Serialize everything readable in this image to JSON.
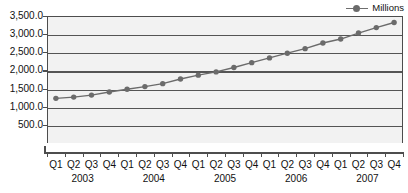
{
  "legend": {
    "position": "top-right",
    "entries": [
      {
        "label": "Millions",
        "marker": "line-circle-marker",
        "color": "#6b6b6b"
      }
    ]
  },
  "colors": {
    "series": "#6b6b6b",
    "marker": "#6b6b6b",
    "gridline": "#555555",
    "axis": "#4d4d4d",
    "plot_background": "#f2f2f2",
    "text": "#111111"
  },
  "chart_data": {
    "type": "line",
    "title": "",
    "subtitle": "",
    "xlabel": "",
    "ylabel": "",
    "ylim": [
      0,
      3500
    ],
    "ytick_labels": [
      "3,500.0",
      "3,000.0",
      "2,500.0",
      "2,000.0",
      "1,500.0",
      "1,000.0",
      "500.0"
    ],
    "ytick_values": [
      3500,
      3000,
      2500,
      2000,
      1500,
      1000,
      500
    ],
    "grid": true,
    "legend_position": "top-right",
    "categories": [
      "Q1 2003",
      "Q2 2003",
      "Q3 2003",
      "Q4 2003",
      "Q1 2004",
      "Q2 2004",
      "Q3 2004",
      "Q4 2004",
      "Q1 2005",
      "Q2 2005",
      "Q3 2005",
      "Q4 2005",
      "Q1 2006",
      "Q2 2006",
      "Q3 2006",
      "Q4 2006",
      "Q1 2007",
      "Q2 2007",
      "Q3 2007",
      "Q4 2007"
    ],
    "quarter_labels": [
      "Q1",
      "Q2",
      "Q3",
      "Q4",
      "Q1",
      "Q2",
      "Q3",
      "Q4",
      "Q1",
      "Q2",
      "Q3",
      "Q4",
      "Q1",
      "Q2",
      "Q3",
      "Q4",
      "Q1",
      "Q2",
      "Q3",
      "Q4"
    ],
    "year_labels": [
      "2003",
      "2004",
      "2005",
      "2006",
      "2007"
    ],
    "series": [
      {
        "name": "Millions",
        "values": [
          1230,
          1265,
          1320,
          1405,
          1480,
          1555,
          1635,
          1765,
          1870,
          1960,
          2080,
          2215,
          2345,
          2475,
          2600,
          2755,
          2865,
          3030,
          3180,
          3320
        ]
      }
    ]
  }
}
